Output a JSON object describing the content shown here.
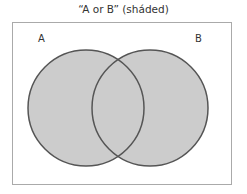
{
  "diagram": {
    "title": "“A or B” (sháded)",
    "label_a": "A",
    "label_b": "B",
    "colors": {
      "fill": "#cccccc",
      "stroke": "#555555",
      "frame": "#aaaaaa"
    }
  }
}
